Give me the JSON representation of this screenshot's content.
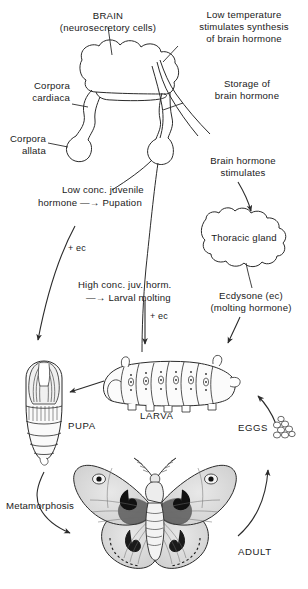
{
  "figure": {
    "type": "biology-diagram"
  },
  "labels": {
    "brain_title": "BRAIN",
    "brain_sub": "(neurosecretory cells)",
    "low_temperature": "Low temperature\nstimulates synthesis\nof brain hormone",
    "corpora_cardiaca": "Corpora\ncardiaca",
    "corpora_allata": "Corpora\nallata",
    "storage_brain_hormone": "Storage of\nbrain hormone",
    "brain_hormone_stimulates": "Brain hormone\nstimulates",
    "thoracic_gland": "Thoracic gland",
    "ecdysone": "Ecdysone (ec)\n(molting hormone)",
    "low_conc_line1": "Low conc. juvenile",
    "low_conc_line2": "hormone —→ Pupation",
    "high_conc_line1": "High conc. juv. horm.",
    "high_conc_line2": "—→ Larval molting",
    "plus_ec_left": "+ ec",
    "plus_ec_center": "+ ec",
    "metamorphosis": "Metamorphosis"
  },
  "stages": {
    "larva": "LARVA",
    "pupa": "PUPA",
    "adult": "ADULT",
    "eggs": "EGGS"
  },
  "colors": {
    "ink": "#1a1a1a",
    "line": "#2b2b2b",
    "wing_fill": "#d6d6d6",
    "wing_fill_light": "#eaeaea",
    "body_fill": "#f2f2f2",
    "background": "#ffffff"
  }
}
